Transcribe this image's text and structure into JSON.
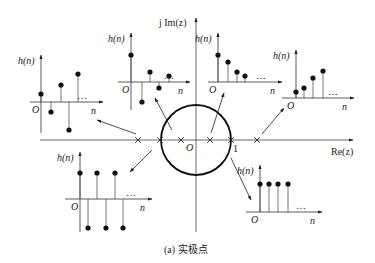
{
  "diagram": {
    "caption": "(a) 实极点",
    "axes": {
      "real_label": "Re(z)",
      "imag_label": "j Im(z)",
      "origin_label": "O",
      "unit_label": "1"
    },
    "unit_circle": {
      "cx": 196,
      "cy": 140,
      "r": 35
    },
    "poles_x": [
      138,
      160,
      181,
      210,
      231,
      257
    ],
    "colors": {
      "ink": "#222222",
      "background": "#ffffff"
    },
    "plots": [
      {
        "id": "alternating-growing",
        "ylabel": "h(n)",
        "xlabel": "n",
        "origin": "O",
        "ellipsis": "…",
        "axis_x": 41,
        "axis_y": 102,
        "x0": 30,
        "x1": 103,
        "y_top": 55,
        "y_bot": 133,
        "stems": [
          [
            41,
            94
          ],
          [
            51,
            112
          ],
          [
            61,
            85
          ],
          [
            69,
            130
          ],
          [
            78,
            74
          ]
        ]
      },
      {
        "id": "alternating-decaying",
        "ylabel": "h(n)",
        "xlabel": "n",
        "origin": "O",
        "ellipsis": "…",
        "axis_x": 131,
        "axis_y": 82,
        "x0": 118,
        "x1": 190,
        "y_top": 33,
        "y_bot": 110,
        "stems": [
          [
            131,
            55
          ],
          [
            142,
            102
          ],
          [
            150,
            72
          ],
          [
            159,
            88
          ],
          [
            169,
            76
          ]
        ]
      },
      {
        "id": "decaying",
        "ylabel": "h(n)",
        "xlabel": "n",
        "origin": "O",
        "ellipsis": "…",
        "axis_x": 218,
        "axis_y": 82,
        "x0": 208,
        "x1": 282,
        "y_top": 33,
        "y_bot": 82,
        "stems": [
          [
            218,
            55
          ],
          [
            228,
            62
          ],
          [
            237,
            72
          ],
          [
            245,
            76
          ]
        ]
      },
      {
        "id": "growing",
        "ylabel": "h(n)",
        "xlabel": "n",
        "origin": "O",
        "ellipsis": "…",
        "axis_x": 296,
        "axis_y": 98,
        "x0": 282,
        "x1": 354,
        "y_top": 50,
        "y_bot": 98,
        "stems": [
          [
            296,
            92
          ],
          [
            304,
            88
          ],
          [
            313,
            78
          ],
          [
            323,
            71
          ]
        ]
      },
      {
        "id": "alternating-constant",
        "ylabel": "h(n)",
        "xlabel": "n",
        "origin": "O",
        "ellipsis": "…",
        "axis_x": 80,
        "axis_y": 199,
        "x0": 65,
        "x1": 152,
        "y_top": 152,
        "y_bot": 232,
        "stems": [
          [
            80,
            173
          ],
          [
            88,
            228
          ],
          [
            97,
            173
          ],
          [
            106,
            228
          ],
          [
            115,
            173
          ],
          [
            123,
            228
          ]
        ]
      },
      {
        "id": "constant",
        "ylabel": "h(n)",
        "xlabel": "n",
        "origin": "O",
        "ellipsis": "…",
        "axis_x": 260,
        "axis_y": 212,
        "x0": 246,
        "x1": 322,
        "y_top": 165,
        "y_bot": 212,
        "stems": [
          [
            260,
            184
          ],
          [
            269,
            184
          ],
          [
            278,
            184
          ],
          [
            288,
            184
          ]
        ]
      }
    ],
    "arrows": [
      {
        "from": [
          136,
          134
        ],
        "to": [
          97,
          120
        ]
      },
      {
        "from": [
          172,
          130
        ],
        "to": [
          155,
          98
        ]
      },
      {
        "from": [
          152,
          150
        ],
        "to": [
          130,
          172
        ]
      },
      {
        "from": [
          211,
          133
        ],
        "to": [
          224,
          93
        ]
      },
      {
        "from": [
          262,
          134
        ],
        "to": [
          284,
          108
        ]
      },
      {
        "from": [
          231,
          158
        ],
        "to": [
          251,
          200
        ]
      }
    ]
  }
}
